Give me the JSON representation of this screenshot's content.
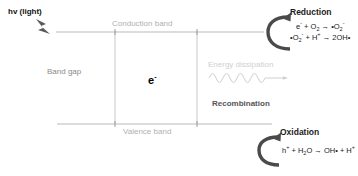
{
  "diagram": {
    "background_color": "#ffffff",
    "labels": {
      "light_source": "hv (light)",
      "conduction_band": "Conduction band",
      "valence_band": "Valence band",
      "band_gap": "Band gap",
      "electron": "e",
      "electron_charge": "-",
      "energy_dissipation": "Energy dissipation",
      "recombination": "Recombination",
      "reduction_heading": "Reduction",
      "oxidation_heading": "Oxidation"
    },
    "reduction_equations": [
      {
        "id": "reduction-eq-1",
        "text": "e⁻ + O₂ → •O₂⁻",
        "parts": [
          {
            "t": "e",
            "s": "sup",
            "v": "-"
          },
          {
            "t": " + O",
            "s": "sub",
            "v": "2"
          },
          {
            "t": " → •O",
            "s": "sub",
            "v": "2"
          },
          {
            "t": "",
            "s": "sup",
            "v": "-"
          }
        ]
      },
      {
        "id": "reduction-eq-2",
        "text": "•O₂⁻ + H⁺ → 2OH•",
        "parts": [
          {
            "t": "•O",
            "s": "sub",
            "v": "2"
          },
          {
            "t": "",
            "s": "sup",
            "v": "-"
          },
          {
            "t": " + H",
            "s": "sup",
            "v": "+"
          },
          {
            "t": " → 2OH•",
            "s": "",
            "v": ""
          }
        ]
      }
    ],
    "oxidation_equations": [
      {
        "id": "oxidation-eq-1",
        "text": "h⁺ + H₂O → OH• + H⁺"
      }
    ],
    "colors": {
      "band_line": "#b9b9b9",
      "band_label_text": "#b0b0b0",
      "bandgap_text": "#8a8a8a",
      "dissipation_text": "#cfcfcf",
      "dissipation_wave": "#cfcfcf",
      "recombination_text": "#555555",
      "heading_text": "#1b1b1b",
      "equation_text": "#1b1b1b",
      "bolt_fill": "#5a5a5a",
      "curved_arrow": "#4a4a4a",
      "electron_text": "#000000"
    },
    "geometry": {
      "conduction_band_y": 32,
      "valence_band_y": 124,
      "band_left_x": 56,
      "band_right_x": 264,
      "gap_left_x": 115,
      "gap_right_x": 197
    }
  }
}
